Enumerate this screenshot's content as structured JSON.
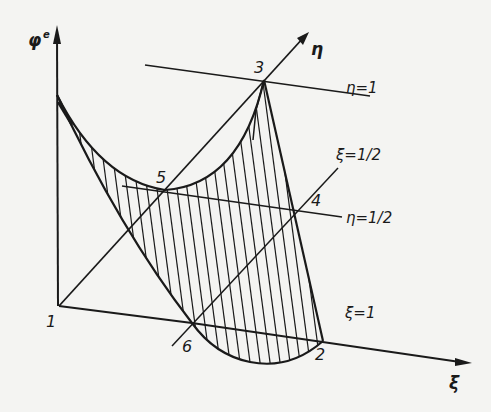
{
  "diagram": {
    "type": "3d-finite-element-shape-function",
    "colors": {
      "background": "#f4f4f2",
      "ink": "#1a1a1a"
    },
    "axes": {
      "vertical": {
        "label": "φ",
        "superscript": "e"
      },
      "eta": {
        "label": "η"
      },
      "xi": {
        "label": "ξ"
      }
    },
    "nodes": [
      {
        "id": "1",
        "label": "1"
      },
      {
        "id": "2",
        "label": "2"
      },
      {
        "id": "3",
        "label": "3"
      },
      {
        "id": "4",
        "label": "4"
      },
      {
        "id": "5",
        "label": "5"
      },
      {
        "id": "6",
        "label": "6"
      }
    ],
    "lines": {
      "eta_1": "η=1",
      "eta_half": "η=1/2",
      "xi_half": "ξ=1/2",
      "xi_1": "ξ=1"
    },
    "shading": "hatched surface (vertical lines)"
  }
}
